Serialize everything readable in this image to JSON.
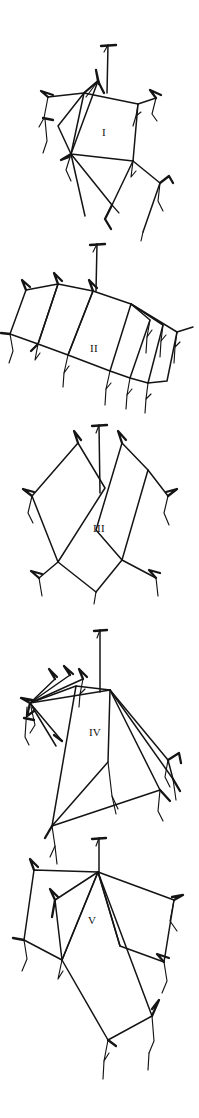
{
  "figure": {
    "kind": "line-drawing-plate",
    "panel_count": 5,
    "background_color": "#ffffff",
    "ink_color": "#141414",
    "width_px": 199,
    "height_px": 1118
  },
  "panels": [
    {
      "label": "I",
      "label_x": 104,
      "label_y": 136,
      "description": "tilted quadrilateral with radiating guy-lines to spined anchor points upper-left and right"
    },
    {
      "label": "II",
      "label_x": 94,
      "label_y": 352,
      "description": "chain of overlapping tilted quadrilaterals fanning from a central vertex"
    },
    {
      "label": "III",
      "label_x": 99,
      "label_y": 532,
      "description": "two elongated quadrilaterals crossing in an X with spined apices"
    },
    {
      "label": "IV",
      "label_x": 95,
      "label_y": 736,
      "description": "elongated quadrilateral with fan of lines converging at left and right vertices"
    },
    {
      "label": "V",
      "label_x": 92,
      "label_y": 924,
      "description": "long quadrilateral overlapped by two shorter quadrilaterals with spined anchors"
    }
  ],
  "geometry": {
    "panel_I": {
      "main_quad": "M 84,93 L 138,104 L 133,161 L 71,154 Z",
      "strokes": [
        "M 108,45 L 107,93",
        "M 101,46 L 116,45",
        "M 108,45 L 104,52",
        "M 84,93 L 98,81 L 104,93",
        "M 98,81 L 96,72 L 99,84",
        "M 84,93 L 48,97",
        "M 48,97 L 42,92 L 53,95",
        "M 48,97 L 44,118 L 39,126",
        "M 44,118 L 52,120",
        "M 44,118 L 47,140 L 43,152",
        "M 84,93 L 58,126 L 71,154",
        "M 98,81 L 71,154",
        "M 98,81 L 86,96",
        "M 138,104 L 156,98",
        "M 156,98 L 151,91 L 160,95",
        "M 156,98 L 152,114 L 157,120",
        "M 138,104 L 136,116 L 141,112",
        "M 136,116 L 133,124",
        "M 71,154 L 66,170 L 71,180",
        "M 71,154 L 62,160 L 68,157",
        "M 133,161 L 131,176 L 136,170",
        "M 133,161 L 160,183",
        "M 160,183 L 168,176 L 172,182",
        "M 160,183 L 158,200 L 163,210",
        "M 71,154 L 112,205",
        "M 112,205 L 133,161",
        "M 112,205 L 105,218 L 111,228",
        "M 112,205 L 119,212",
        "M 160,183 L 143,230",
        "M 71,154 L 84,214"
      ]
    },
    "panel_II": {
      "main_quad": "M 93,291 L 131,304 L 110,371 L 68,355 Z",
      "strokes": [
        "M 97,244 L 96,291",
        "M 90,245 L 104,244",
        "M 97,244 L 93,251",
        "M 93,291 L 58,284 L 38,344 L 68,355 Z",
        "M 58,284 L 55,274 L 62,281",
        "M 93,291 L 89,281 L 96,288",
        "M 58,284 L 26,290 L 10,334 L 38,344 Z",
        "M 26,290 L 23,281 L 30,287",
        "M 10,334 L 2,333",
        "M 10,334 L 13,350 L 9,362",
        "M 38,344 L 35,359 L 40,353",
        "M 38,344 L 32,351",
        "M 68,355 L 64,372 L 69,366",
        "M 131,304 L 150,320 L 130,378 L 110,371 Z",
        "M 131,304 L 163,325 L 148,383 L 130,378 Z",
        "M 131,304 L 176,332 L 166,380 L 148,383",
        "M 150,320 L 147,336 L 152,330",
        "M 147,336 L 146,352",
        "M 163,325 L 161,340 L 166,335",
        "M 161,340 L 160,356",
        "M 176,332 L 174,346 L 179,341",
        "M 174,346 L 173,362",
        "M 176,332 L 192,327",
        "M 110,371 L 106,388 L 111,382",
        "M 106,388 L 105,404",
        "M 130,378 L 127,394 L 132,388",
        "M 127,394 L 126,408",
        "M 148,383 L 146,398 L 151,393",
        "M 146,398 L 145,412",
        "M 68,355 L 66,370"
      ]
    },
    "panel_III": {
      "main_quads": [
        "M 78,443 L 105,488 L 58,562 L 32,534 Z",
        "M 122,443 L 148,470 L 122,560 L 96,530 Z"
      ],
      "strokes": [
        "M 99,425 L 100,492",
        "M 93,426 L 107,425",
        "M 99,425 L 96,432",
        "M 78,443 L 75,432 L 81,440",
        "M 78,443 L 32,496",
        "M 32,496 L 24,490 L 33,492",
        "M 32,496 L 28,512 L 33,522",
        "M 32,496 L 58,562",
        "M 58,562 L 40,578",
        "M 40,578 L 32,572 L 41,574",
        "M 40,578 L 43,595",
        "M 58,562 L 105,488",
        "M 105,488 L 122,443",
        "M 122,443 L 119,432 L 125,440",
        "M 122,443 L 168,496",
        "M 168,496 L 176,490 L 167,492",
        "M 168,496 L 164,512 L 169,524",
        "M 168,496 L 148,470",
        "M 148,470 L 122,560",
        "M 122,560 L 155,578",
        "M 155,578 L 150,570 L 158,573",
        "M 155,578 L 157,595",
        "M 58,562 L 96,590",
        "M 122,560 L 96,590",
        "M 96,530 L 122,443"
      ]
    },
    "panel_IV": {
      "main_quad": "M 76,686 L 110,690 L 108,762 L 52,826",
      "strokes": [
        "M 100,630 L 100,692",
        "M 94,631 L 107,630",
        "M 100,630 L 97,637",
        "M 110,690 L 52,690 L 30,703",
        "M 30,703 L 22,698 L 32,700",
        "M 30,703 L 28,716 L 33,711",
        "M 30,703 L 35,724 L 30,732",
        "M 30,703 L 26,736 L 30,744",
        "M 30,703 L 55,680",
        "M 55,680 L 50,670 L 57,677",
        "M 30,703 L 70,676",
        "M 70,676 L 65,667 L 72,674",
        "M 30,703 L 83,680",
        "M 83,680 L 80,670 L 86,677",
        "M 83,680 L 80,694 L 85,689",
        "M 80,694 L 79,706",
        "M 30,703 L 76,686",
        "M 30,703 L 62,740",
        "M 62,740 L 55,735",
        "M 30,703 L 55,745",
        "M 110,690 L 168,760",
        "M 110,690 L 172,778",
        "M 110,690 L 160,790",
        "M 168,760 L 178,753 L 180,762",
        "M 168,760 L 165,776 L 170,786",
        "M 172,778 L 178,790",
        "M 110,690 L 108,762",
        "M 76,686 L 52,826",
        "M 108,762 L 112,795 L 118,808",
        "M 52,826 L 160,790",
        "M 160,790 L 170,800",
        "M 52,826 L 54,845 L 49,855",
        "M 52,826 L 45,838",
        "M 112,795 L 116,812",
        "M 160,790 L 158,810 L 163,820"
      ]
    },
    "panel_V": {
      "main_quad": "M 98,870 L 98,872 L 152,1016 L 108,1040 Z",
      "strokes": [
        "M 99,838 L 99,872",
        "M 93,839 L 106,838",
        "M 99,838 L 96,845",
        "M 98,872 L 34,870 L 24,940 L 62,960 Z",
        "M 34,870 L 31,860 L 38,867",
        "M 24,940 L 14,938",
        "M 24,940 L 27,958 L 22,970",
        "M 62,960 L 58,978 L 63,970",
        "M 98,872 L 55,900 L 62,960",
        "M 55,900 L 51,890 L 58,897",
        "M 55,900 L 52,916",
        "M 98,872 L 62,960 L 108,1040 L 152,1016 Z",
        "M 98,872 L 174,900 L 164,962 L 120,946",
        "M 174,900 L 182,895 L 173,897",
        "M 174,900 L 170,920 L 176,930",
        "M 164,962 L 158,955 L 168,958",
        "M 164,962 L 166,980 L 161,992",
        "M 98,872 L 120,946",
        "M 120,946 L 164,962",
        "M 152,1016 L 158,1000 L 152,1008",
        "M 152,1016 L 154,1040 L 149,1052",
        "M 108,1040 L 104,1060 L 109,1052",
        "M 108,1040 L 115,1046",
        "M 104,1060 L 103,1078"
      ]
    }
  }
}
